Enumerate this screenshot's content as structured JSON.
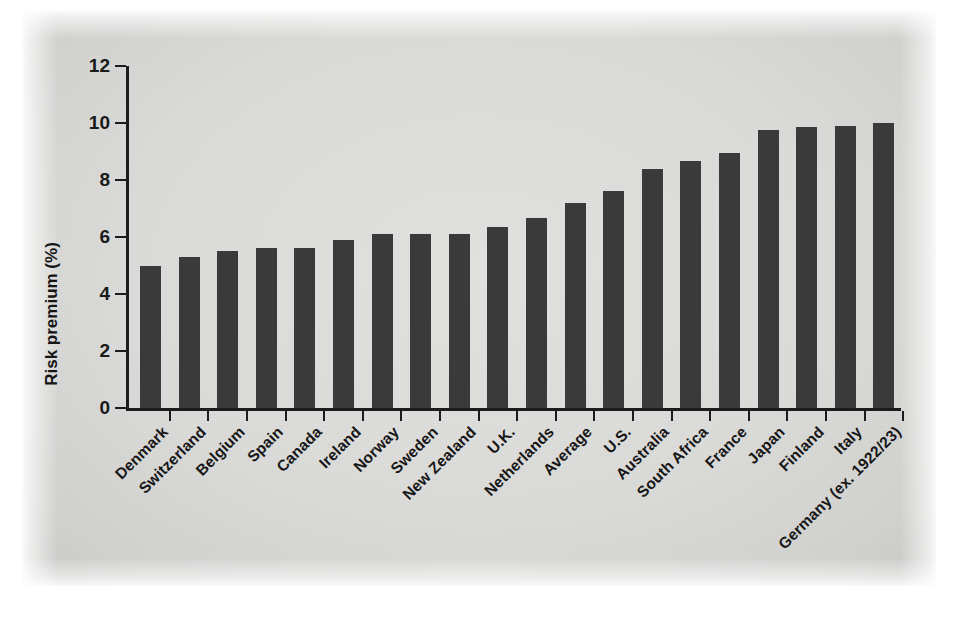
{
  "chart_data": {
    "type": "bar",
    "title": "",
    "subtitle": "",
    "xlabel": "",
    "ylabel": "Risk premium (%)",
    "ylim": [
      0,
      12
    ],
    "yticks": [
      0,
      2,
      4,
      6,
      8,
      10,
      12
    ],
    "ytick_labels": [
      "0",
      "2",
      "4",
      "6",
      "8",
      "10",
      "12"
    ],
    "grid": false,
    "legend": "none",
    "bar_color": "#3a3a3a",
    "axis_color": "#1c1c1c",
    "background_color": "#dcdcda",
    "categories": [
      "Denmark",
      "Switzerland",
      "Belgium",
      "Spain",
      "Canada",
      "Ireland",
      "Norway",
      "Sweden",
      "New Zealand",
      "U.K.",
      "Netherlands",
      "Average",
      "U.S.",
      "Australia",
      "South Africa",
      "France",
      "Japan",
      "Finland",
      "Italy",
      "Germany (ex. 1922/23)"
    ],
    "values": [
      5.0,
      5.3,
      5.5,
      5.6,
      5.6,
      5.9,
      6.1,
      6.1,
      6.1,
      6.35,
      6.65,
      7.2,
      7.6,
      8.4,
      8.65,
      8.95,
      9.75,
      9.85,
      9.9,
      10.0
    ]
  }
}
